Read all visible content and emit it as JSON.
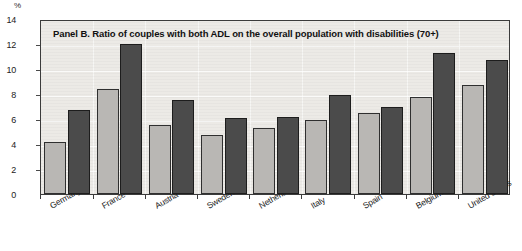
{
  "chart_data": {
    "type": "bar",
    "title": "Panel B.  Ratio of couples with both ADL on the overall population with disabilities (70+)",
    "xlabel": "",
    "ylabel": "%",
    "unit_label": "%",
    "ylim": [
      0,
      14
    ],
    "yticks": [
      0,
      2,
      4,
      6,
      8,
      10,
      12,
      14
    ],
    "grid": true,
    "legend": "none",
    "categories": [
      "Germany",
      "France",
      "Austria",
      "Sweden",
      "Netherlands",
      "Italy",
      "Spain",
      "Belgium",
      "United States"
    ],
    "series": [
      {
        "name": "light-bar",
        "color": "#b9b7b4",
        "values": [
          4.2,
          8.4,
          5.5,
          4.7,
          5.3,
          5.9,
          6.5,
          7.8,
          8.7
        ]
      },
      {
        "name": "dark-bar",
        "color": "#4b4b4b",
        "values": [
          6.7,
          12.0,
          7.5,
          6.1,
          6.2,
          7.9,
          7.0,
          11.3,
          10.7
        ]
      }
    ]
  },
  "colors": {
    "plot_background": "#eceae6",
    "frame": "#3b3b3b",
    "light_bar": "#b9b7b4",
    "dark_bar": "#4b4b4b",
    "page_background": "#ffffff"
  }
}
